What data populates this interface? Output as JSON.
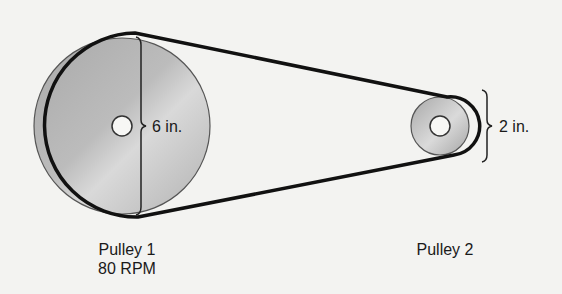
{
  "diagram": {
    "pulley1": {
      "name": "Pulley 1",
      "speed": "80 RPM",
      "diameter_label": "6 in.",
      "fill": "#bdbdbd"
    },
    "pulley2": {
      "name": "Pulley 2",
      "diameter_label": "2 in.",
      "fill": "#b8b8b8"
    },
    "belt_color": "#111111",
    "background": "#f3f3f1"
  }
}
